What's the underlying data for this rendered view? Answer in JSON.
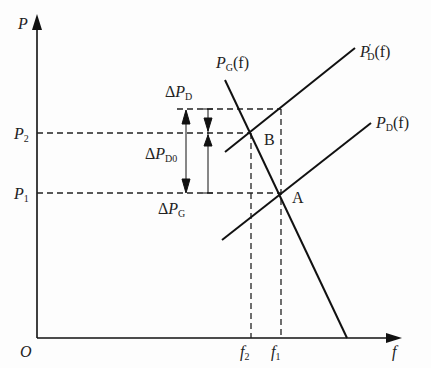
{
  "diagram": {
    "axes": {
      "y_label": "P",
      "x_label": "f",
      "origin": "O"
    },
    "y_ticks": [
      {
        "label": "P",
        "sub": "2"
      },
      {
        "label": "P",
        "sub": "1"
      }
    ],
    "x_ticks": [
      {
        "label": "f",
        "sub": "2"
      },
      {
        "label": "f",
        "sub": "1"
      }
    ],
    "curves": {
      "generation": {
        "name": "P",
        "sub": "G",
        "arg": "(f)"
      },
      "load_new": {
        "name": "P",
        "prime": "′",
        "sub": "D",
        "arg": "(f)"
      },
      "load": {
        "name": "P",
        "sub": "D",
        "arg": "(f)"
      }
    },
    "points": {
      "A": "A",
      "B": "B"
    },
    "deltas": {
      "dPD": {
        "delta": "Δ",
        "name": "P",
        "sub": "D"
      },
      "dPD0": {
        "delta": "Δ",
        "name": "P",
        "sub": "D0"
      },
      "dPG": {
        "delta": "Δ",
        "name": "P",
        "sub": "G"
      }
    }
  }
}
